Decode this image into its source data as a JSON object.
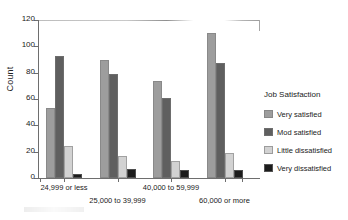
{
  "chart_data": {
    "type": "bar",
    "title": "",
    "xlabel": "",
    "ylabel": "Count",
    "ylim": [
      0,
      120
    ],
    "yticks": [
      0,
      20,
      40,
      60,
      80,
      100,
      120
    ],
    "grid": false,
    "legend_position": "right",
    "legend_title": "Job Satisfaction",
    "categories": [
      "24,999 or less",
      "25,000 to 39,999",
      "40,000 to 59,999",
      "60,000 or more"
    ],
    "series": [
      {
        "name": "Very satisfied",
        "color": "#9d9d9d",
        "values": [
          53,
          90,
          74,
          110
        ]
      },
      {
        "name": "Mod satisfied",
        "color": "#5f5f5f",
        "values": [
          93,
          79,
          61,
          87
        ]
      },
      {
        "name": "Little dissatisfied",
        "color": "#d2d2d2",
        "values": [
          24,
          17,
          13,
          19
        ]
      },
      {
        "name": "Very dissatisfied",
        "color": "#1c1c1c",
        "values": [
          3,
          7,
          6,
          6
        ]
      }
    ]
  },
  "axis": {
    "y_label": "Count",
    "y_tick_labels": [
      "0",
      "20",
      "40",
      "60",
      "80",
      "100",
      "120"
    ],
    "x_tick_labels": [
      "24,999 or less",
      "25,000 to 39,999",
      "40,000 to 59,999",
      "60,000 or more"
    ]
  },
  "legend": {
    "title": "Job Satisfaction",
    "items": [
      {
        "label": "Very satisfied"
      },
      {
        "label": "Mod satisfied"
      },
      {
        "label": "Little dissatisfied"
      },
      {
        "label": "Very dissatisfied"
      }
    ]
  }
}
